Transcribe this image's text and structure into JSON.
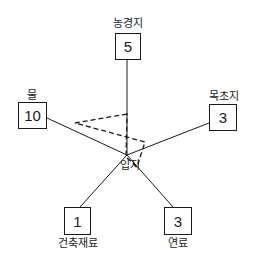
{
  "diagram": {
    "center_label": "입지",
    "nodes": [
      {
        "id": "farmland",
        "label": "농경지",
        "value": "5"
      },
      {
        "id": "water",
        "label": "물",
        "value": "10"
      },
      {
        "id": "pasture",
        "label": "목초지",
        "value": "3"
      },
      {
        "id": "building_materials",
        "label": "건축재료",
        "value": "1"
      },
      {
        "id": "fuel",
        "label": "연료",
        "value": "3"
      }
    ]
  }
}
